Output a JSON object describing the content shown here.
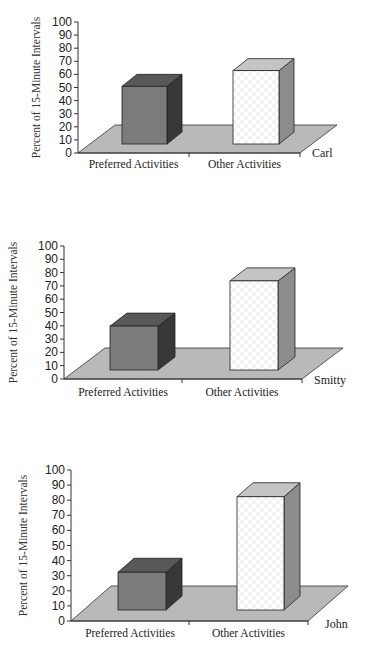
{
  "chart_data": [
    {
      "type": "bar",
      "style": "3d-column",
      "title": "",
      "series_label": "Carl",
      "categories": [
        "Preferred Activities",
        "Other Activities"
      ],
      "values": [
        44,
        56
      ],
      "xlabel": "",
      "ylabel": "Percent of 15-Minute Intervals",
      "ylim": [
        0,
        100
      ],
      "yticks": [
        0,
        10,
        20,
        30,
        40,
        50,
        60,
        70,
        80,
        90,
        100
      ],
      "grid": false,
      "legend": "none"
    },
    {
      "type": "bar",
      "style": "3d-column",
      "title": "",
      "series_label": "Smitty",
      "categories": [
        "Preferred Activities",
        "Other Activities"
      ],
      "values": [
        33,
        67
      ],
      "xlabel": "",
      "ylabel": "Percent of 15-Minute Intervals",
      "ylim": [
        0,
        100
      ],
      "yticks": [
        0,
        10,
        20,
        30,
        40,
        50,
        60,
        70,
        80,
        90,
        100
      ],
      "grid": false,
      "legend": "none"
    },
    {
      "type": "bar",
      "style": "3d-column",
      "title": "",
      "series_label": "John",
      "categories": [
        "Preferred Activities",
        "Other Activities"
      ],
      "values": [
        25,
        75
      ],
      "xlabel": "",
      "ylabel": "Percent of 15-Minute Intervals",
      "ylim": [
        0,
        100
      ],
      "yticks": [
        0,
        10,
        20,
        30,
        40,
        50,
        60,
        70,
        80,
        90,
        100
      ],
      "grid": false,
      "legend": "none"
    }
  ],
  "colors": {
    "preferred_front": "#7b7b7b",
    "preferred_top": "#585858",
    "preferred_side": "#383838",
    "other_front": "#ffffff",
    "other_top": "#c4c4c4",
    "other_side": "#8c8c8c",
    "floor": "#b9b9b9",
    "axis": "#333333"
  },
  "layout": [
    {
      "top": 0,
      "height": 210,
      "axis_x": 78,
      "y0": 153,
      "y100": 22,
      "floor_depth_dx": 37,
      "floor_depth_dy": 28,
      "floor_right": 300,
      "bar_base": 144,
      "bars": [
        {
          "x": 122,
          "w": 45
        },
        {
          "x": 233,
          "w": 46
        }
      ],
      "bar_dx": 15,
      "bar_dy": 12,
      "ylabel_x": 40,
      "cat_y": 168,
      "series_x": 312,
      "series_y": 157,
      "mid_tick": 189
    },
    {
      "top": 225,
      "height": 185,
      "axis_x": 64,
      "y0": 379,
      "y100": 246,
      "floor_depth_dx": 41,
      "floor_depth_dy": 31,
      "floor_right": 302,
      "bar_base": 370,
      "bars": [
        {
          "x": 110,
          "w": 48
        },
        {
          "x": 230,
          "w": 48
        }
      ],
      "bar_dx": 17,
      "bar_dy": 13,
      "ylabel_x": 17,
      "cat_y": 396,
      "series_x": 314,
      "series_y": 384,
      "mid_tick": 182
    },
    {
      "top": 455,
      "height": 200,
      "axis_x": 71,
      "y0": 621,
      "y100": 470,
      "floor_depth_dx": 40,
      "floor_depth_dy": 35,
      "floor_right": 308,
      "bar_base": 610,
      "bars": [
        {
          "x": 118,
          "w": 48
        },
        {
          "x": 237,
          "w": 47
        }
      ],
      "bar_dx": 16,
      "bar_dy": 14,
      "ylabel_x": 27,
      "cat_y": 637,
      "series_x": 325,
      "series_y": 628,
      "mid_tick": 189
    }
  ]
}
